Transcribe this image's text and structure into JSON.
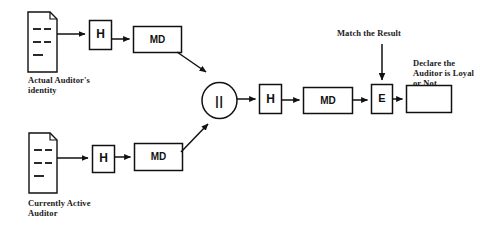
{
  "diagram": {
    "type": "flowchart",
    "background_color": "#ffffff",
    "stroke_color": "#111111",
    "text_color": "#1a1a1a"
  },
  "nodes": {
    "doc_actual": {
      "shape": "document",
      "label": "",
      "caption_line1": "Actual Auditor's",
      "caption_line2": "identity"
    },
    "doc_current": {
      "shape": "document",
      "label": "",
      "caption_line1": "Currently Active",
      "caption_line2": "Auditor"
    },
    "hash_top": {
      "shape": "rect",
      "label": "H"
    },
    "md_top": {
      "shape": "rect",
      "label": "MD"
    },
    "hash_bottom": {
      "shape": "rect",
      "label": "H"
    },
    "md_bottom": {
      "shape": "rect",
      "label": "MD"
    },
    "concat": {
      "shape": "ellipse",
      "label": "||"
    },
    "hash_mid": {
      "shape": "rect",
      "label": "H"
    },
    "md_mid": {
      "shape": "rect",
      "label": "MD"
    },
    "encrypt": {
      "shape": "rect",
      "label": "E"
    },
    "result_box": {
      "shape": "rect",
      "label": ""
    }
  },
  "annotations": {
    "match_the_result": "Match the Result",
    "declare_line1": "Declare the",
    "declare_line2": "Auditor is Loyal",
    "declare_line3": "or Not"
  },
  "edges": [
    {
      "from": "doc_actual",
      "to": "hash_top",
      "style": "arrow"
    },
    {
      "from": "hash_top",
      "to": "md_top",
      "style": "arrow"
    },
    {
      "from": "md_top",
      "to": "concat",
      "style": "arrow-diagonal"
    },
    {
      "from": "doc_current",
      "to": "hash_bottom",
      "style": "arrow"
    },
    {
      "from": "hash_bottom",
      "to": "md_bottom",
      "style": "arrow"
    },
    {
      "from": "md_bottom",
      "to": "concat",
      "style": "arrow-diagonal"
    },
    {
      "from": "concat",
      "to": "hash_mid",
      "style": "arrow"
    },
    {
      "from": "hash_mid",
      "to": "md_mid",
      "style": "arrow"
    },
    {
      "from": "md_mid",
      "to": "encrypt",
      "style": "arrow"
    },
    {
      "from": "match_the_result",
      "to": "encrypt",
      "style": "arrow-vertical"
    },
    {
      "from": "encrypt",
      "to": "result_box",
      "style": "arrow"
    }
  ]
}
